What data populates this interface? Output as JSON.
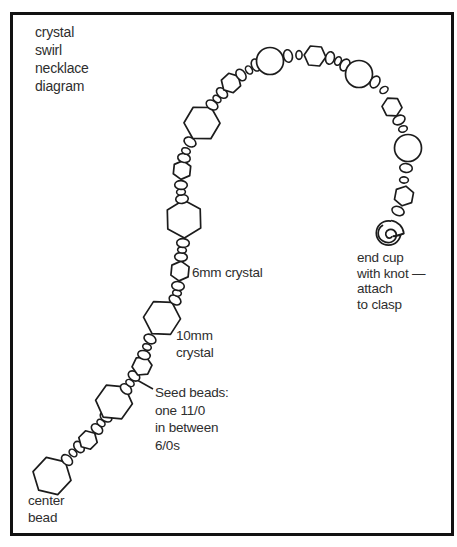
{
  "colors": {
    "line": "#1c1c1c",
    "text": "#2e2e2e",
    "background": "#ffffff",
    "frame_border": "#121212"
  },
  "labels": {
    "title": {
      "lines": [
        "crystal",
        "swirl",
        "necklace",
        "diagram"
      ]
    },
    "crystal_6mm": {
      "text": "6mm crystal"
    },
    "crystal_10mm": {
      "lines": [
        "10mm",
        "crystal"
      ]
    },
    "seed_note": {
      "lines": [
        "Seed beads:",
        "one 11/0",
        "in between",
        "6/0s"
      ]
    },
    "center_bead": {
      "lines": [
        "center",
        "bead"
      ]
    },
    "end_cup": {
      "lines": [
        "end cup",
        "with knot —",
        "attach",
        "to clasp"
      ]
    }
  },
  "necklace": {
    "pointer_line": {
      "x1": 137,
      "y1": 380,
      "x2": 153,
      "y2": 389
    },
    "beads": [
      {
        "t": "hex",
        "x": 52,
        "y": 476,
        "r": 19.5
      },
      {
        "t": "seed",
        "x": 67,
        "y": 460,
        "r": 6.3
      },
      {
        "t": "seedS",
        "x": 73,
        "y": 453,
        "r": 4.4
      },
      {
        "t": "seed",
        "x": 79,
        "y": 447,
        "r": 6.3
      },
      {
        "t": "hex",
        "x": 88,
        "y": 440,
        "r": 9.5
      },
      {
        "t": "seed",
        "x": 97,
        "y": 429,
        "r": 6.3
      },
      {
        "t": "seedS",
        "x": 101,
        "y": 423,
        "r": 4.4
      },
      {
        "t": "seed",
        "x": 106,
        "y": 417,
        "r": 6.3
      },
      {
        "t": "hex",
        "x": 114,
        "y": 402,
        "r": 18.5
      },
      {
        "t": "seed",
        "x": 126,
        "y": 389,
        "r": 6.3
      },
      {
        "t": "seedS",
        "x": 130,
        "y": 383,
        "r": 4.4
      },
      {
        "t": "seed",
        "x": 134,
        "y": 376,
        "r": 6.3
      },
      {
        "t": "hex",
        "x": 142,
        "y": 366,
        "r": 10
      },
      {
        "t": "seed",
        "x": 144,
        "y": 355,
        "r": 6.3
      },
      {
        "t": "seedS",
        "x": 147,
        "y": 347,
        "r": 4.4
      },
      {
        "t": "seed",
        "x": 150,
        "y": 339,
        "r": 6.3
      },
      {
        "t": "hex",
        "x": 162,
        "y": 318,
        "r": 18.5
      },
      {
        "t": "seed",
        "x": 175,
        "y": 300,
        "r": 6.3
      },
      {
        "t": "seedS",
        "x": 177,
        "y": 293,
        "r": 4.4
      },
      {
        "t": "seed",
        "x": 178,
        "y": 286,
        "r": 6.3
      },
      {
        "t": "hex",
        "x": 180,
        "y": 271,
        "r": 10
      },
      {
        "t": "seed",
        "x": 181,
        "y": 257,
        "r": 6.3
      },
      {
        "t": "seedS",
        "x": 182,
        "y": 250,
        "r": 4.4
      },
      {
        "t": "seed",
        "x": 183,
        "y": 243,
        "r": 6.3
      },
      {
        "t": "hex",
        "x": 184,
        "y": 219,
        "r": 19
      },
      {
        "t": "seed",
        "x": 182,
        "y": 199,
        "r": 6.3
      },
      {
        "t": "seedS",
        "x": 181,
        "y": 192,
        "r": 4.4
      },
      {
        "t": "seed",
        "x": 181,
        "y": 185,
        "r": 6.3
      },
      {
        "t": "hex",
        "x": 182,
        "y": 170,
        "r": 9.5
      },
      {
        "t": "seed",
        "x": 184,
        "y": 158,
        "r": 6.3
      },
      {
        "t": "seedS",
        "x": 186,
        "y": 151,
        "r": 4.4
      },
      {
        "t": "seed",
        "x": 190,
        "y": 142,
        "r": 6.3
      },
      {
        "t": "hex",
        "x": 202,
        "y": 123,
        "r": 18
      },
      {
        "t": "seed",
        "x": 212,
        "y": 105,
        "r": 6.3
      },
      {
        "t": "seedS",
        "x": 217,
        "y": 99,
        "r": 4.4
      },
      {
        "t": "seed",
        "x": 222,
        "y": 93,
        "r": 6.3
      },
      {
        "t": "hex",
        "x": 231,
        "y": 83,
        "r": 10
      },
      {
        "t": "seed",
        "x": 241,
        "y": 75,
        "r": 6.3
      },
      {
        "t": "seedS",
        "x": 249,
        "y": 70,
        "r": 4.4
      },
      {
        "t": "seed",
        "x": 256,
        "y": 65,
        "r": 6.3
      },
      {
        "t": "circle",
        "x": 270,
        "y": 61,
        "r": 13.5
      },
      {
        "t": "seed",
        "x": 288,
        "y": 56,
        "r": 6.3
      },
      {
        "t": "seedS",
        "x": 299,
        "y": 55,
        "r": 4.4
      },
      {
        "t": "hex",
        "x": 315,
        "y": 56,
        "r": 11
      },
      {
        "t": "seed",
        "x": 330,
        "y": 58,
        "r": 6.3
      },
      {
        "t": "seedS",
        "x": 338,
        "y": 61,
        "r": 4.4
      },
      {
        "t": "seed",
        "x": 345,
        "y": 65,
        "r": 6.3
      },
      {
        "t": "circle",
        "x": 359,
        "y": 74,
        "r": 13.5
      },
      {
        "t": "seed",
        "x": 375,
        "y": 82,
        "r": 6.3
      },
      {
        "t": "seedS",
        "x": 384,
        "y": 90,
        "r": 4.4
      },
      {
        "t": "hex",
        "x": 392,
        "y": 107,
        "r": 10
      },
      {
        "t": "seed",
        "x": 399,
        "y": 120,
        "r": 6.3
      },
      {
        "t": "seedS",
        "x": 403,
        "y": 129,
        "r": 4.4
      },
      {
        "t": "circle",
        "x": 408,
        "y": 148,
        "r": 13.5
      },
      {
        "t": "seed",
        "x": 406,
        "y": 168,
        "r": 6.3
      },
      {
        "t": "seedS",
        "x": 404,
        "y": 180,
        "r": 4.4
      },
      {
        "t": "hex",
        "x": 404,
        "y": 196,
        "r": 10
      },
      {
        "t": "seed",
        "x": 398,
        "y": 211,
        "r": 6.3
      },
      {
        "t": "endcup",
        "x": 389,
        "y": 232,
        "r": 12.5
      }
    ]
  }
}
